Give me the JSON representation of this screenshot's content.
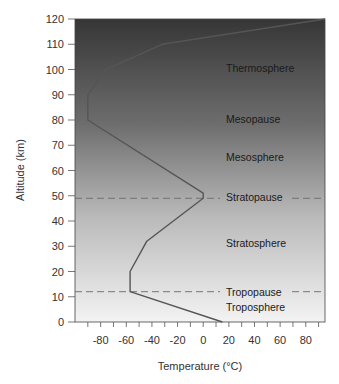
{
  "chart_data": {
    "type": "line",
    "title": "",
    "xlabel": "Temperature (°C)",
    "ylabel": "Altitude (km)",
    "xlim": [
      -100,
      95
    ],
    "ylim": [
      0,
      120
    ],
    "xticks": [
      -80,
      -60,
      -40,
      -20,
      0,
      20,
      40,
      60,
      80
    ],
    "xminor_step": 10,
    "yticks": [
      0,
      10,
      20,
      30,
      40,
      50,
      60,
      70,
      80,
      90,
      100,
      110,
      120
    ],
    "grid": false,
    "background": "vertical gradient, dark gray at top to light gray at bottom",
    "series": [
      {
        "name": "Temperature profile",
        "x": [
          15,
          -57,
          -57,
          -44,
          0,
          0,
          -90,
          -90,
          -76,
          -32,
          95
        ],
        "y": [
          0,
          12,
          20,
          32,
          49,
          51,
          80,
          90,
          100,
          110,
          120
        ]
      }
    ],
    "boundaries": [
      {
        "name": "Tropopause",
        "altitude": 12
      },
      {
        "name": "Stratopause",
        "altitude": 49
      },
      {
        "name": "Mesopause",
        "altitude": 80
      }
    ],
    "layers": [
      {
        "name": "Troposphere",
        "altitude": 6
      },
      {
        "name": "Stratosphere",
        "altitude": 30
      },
      {
        "name": "Mesosphere",
        "altitude": 65
      },
      {
        "name": "Thermosphere",
        "altitude": 100
      }
    ]
  },
  "labels": {
    "xlabel": "Temperature (°C)",
    "ylabel": "Altitude (km)",
    "thermosphere": "Thermosphere",
    "mesopause": "Mesopause",
    "mesosphere": "Mesosphere",
    "stratopause": "Stratopause",
    "stratosphere": "Stratosphere",
    "tropopause": "Tropopause",
    "troposphere": "Troposphere"
  },
  "colors": {
    "gradient_top": "#3a3a3a",
    "gradient_bottom": "#f2f2f2",
    "curve": "#555555",
    "dashed": "#6a6a6a"
  }
}
